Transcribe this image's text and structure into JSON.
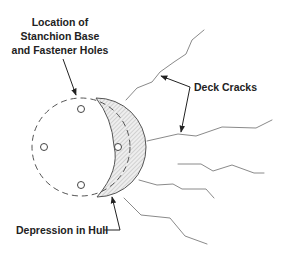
{
  "diagram": {
    "type": "technical-illustration",
    "labels": {
      "stanchion": {
        "line1": "Location of",
        "line2": "Stanchion Base",
        "line3": "and Fastener Holes"
      },
      "deck_cracks": "Deck Cracks",
      "depression": "Depression in Hull"
    },
    "elements": {
      "stanchion_base": {
        "shape": "dashed-circle",
        "fastener_holes": 4
      },
      "depression": {
        "shape": "hatched-crescent"
      },
      "deck_cracks": {
        "count": 5
      }
    },
    "colors": {
      "text": "#222222",
      "crack_line": "#8a8a8a",
      "outline": "#555555",
      "hatch": "#bbbbbb",
      "background": "#ffffff"
    }
  }
}
